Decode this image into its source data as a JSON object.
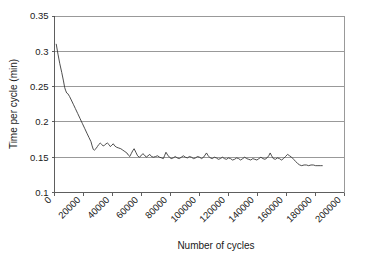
{
  "chart_data": {
    "type": "line",
    "title": "",
    "xlabel": "Number of cycles",
    "ylabel": "Time per cycle (min)",
    "xlim": [
      0,
      200000
    ],
    "ylim": [
      0.1,
      0.35
    ],
    "grid": "horizontal",
    "legend": "none",
    "xticks": [
      0,
      20000,
      40000,
      60000,
      80000,
      100000,
      120000,
      140000,
      160000,
      180000,
      200000
    ],
    "xtick_labels": [
      "0",
      "20000",
      "40000",
      "60000",
      "80000",
      "100000",
      "120000",
      "140000",
      "160000",
      "180000",
      "200000"
    ],
    "yticks": [
      0.1,
      0.15,
      0.2,
      0.25,
      0.3,
      0.35
    ],
    "ytick_labels": [
      "0.1",
      "0.15",
      "0.2",
      "0.25",
      "0.3",
      "0.35"
    ],
    "series": [
      {
        "name": "Time per cycle",
        "color": "#3a3a3a",
        "x": [
          1200,
          2400,
          3600,
          5000,
          6200,
          7000,
          7600,
          8400,
          9200,
          10400,
          11600,
          13000,
          14400,
          16000,
          17600,
          19200,
          20800,
          22400,
          23800,
          25200,
          26000,
          26800,
          27600,
          28600,
          29600,
          30600,
          31600,
          32600,
          33600,
          34600,
          35600,
          36600,
          37600,
          38600,
          39600,
          40600,
          41600,
          43000,
          44400,
          45800,
          47200,
          48600,
          50000,
          51000,
          52000,
          53000,
          54000,
          55000,
          56200,
          57400,
          58600,
          59800,
          61000,
          62200,
          63400,
          64600,
          65800,
          67000,
          68400,
          69800,
          71200,
          72600,
          74000,
          75200,
          76000,
          77000,
          78200,
          79400,
          80600,
          82000,
          83400,
          84800,
          86200,
          87600,
          89000,
          90400,
          91800,
          93200,
          94600,
          96000,
          97400,
          98800,
          100200,
          101600,
          103000,
          104000,
          105000,
          106200,
          107600,
          109000,
          110400,
          111800,
          113200,
          114600,
          116000,
          117400,
          118800,
          120200,
          121600,
          123000,
          124400,
          125800,
          127200,
          128600,
          130000,
          131400,
          132800,
          134200,
          135600,
          137000,
          138400,
          139800,
          141200,
          142600,
          144000,
          145400,
          146800,
          148000,
          149000,
          150000,
          151200,
          152600,
          154000,
          155400,
          156800,
          158200,
          159600,
          161000,
          162400,
          163800,
          165200,
          166600,
          168000,
          169400,
          170800,
          172400,
          174000,
          175600,
          177200,
          178800,
          180400,
          182000,
          183600,
          185000
        ],
        "y": [
          0.31,
          0.296,
          0.283,
          0.27,
          0.258,
          0.249,
          0.245,
          0.241,
          0.24,
          0.236,
          0.231,
          0.225,
          0.219,
          0.212,
          0.205,
          0.198,
          0.191,
          0.184,
          0.178,
          0.172,
          0.166,
          0.161,
          0.16,
          0.162,
          0.165,
          0.168,
          0.17,
          0.168,
          0.166,
          0.167,
          0.169,
          0.17,
          0.168,
          0.165,
          0.167,
          0.169,
          0.166,
          0.164,
          0.163,
          0.162,
          0.16,
          0.158,
          0.156,
          0.153,
          0.151,
          0.155,
          0.159,
          0.162,
          0.157,
          0.152,
          0.15,
          0.152,
          0.155,
          0.153,
          0.15,
          0.152,
          0.154,
          0.151,
          0.15,
          0.151,
          0.152,
          0.15,
          0.149,
          0.148,
          0.152,
          0.157,
          0.153,
          0.15,
          0.148,
          0.149,
          0.151,
          0.149,
          0.148,
          0.15,
          0.152,
          0.15,
          0.149,
          0.151,
          0.15,
          0.148,
          0.149,
          0.151,
          0.15,
          0.148,
          0.15,
          0.153,
          0.156,
          0.152,
          0.149,
          0.148,
          0.15,
          0.149,
          0.147,
          0.148,
          0.15,
          0.148,
          0.147,
          0.149,
          0.148,
          0.146,
          0.147,
          0.149,
          0.148,
          0.146,
          0.148,
          0.15,
          0.148,
          0.147,
          0.146,
          0.148,
          0.147,
          0.146,
          0.148,
          0.15,
          0.148,
          0.147,
          0.149,
          0.152,
          0.156,
          0.152,
          0.148,
          0.147,
          0.149,
          0.148,
          0.146,
          0.148,
          0.151,
          0.154,
          0.152,
          0.15,
          0.147,
          0.144,
          0.141,
          0.139,
          0.138,
          0.139,
          0.139,
          0.138,
          0.139,
          0.139,
          0.138,
          0.138,
          0.138,
          0.138
        ]
      }
    ]
  },
  "axes": {
    "y_title": "Time per cycle (min)",
    "x_title": "Number of cycles"
  }
}
